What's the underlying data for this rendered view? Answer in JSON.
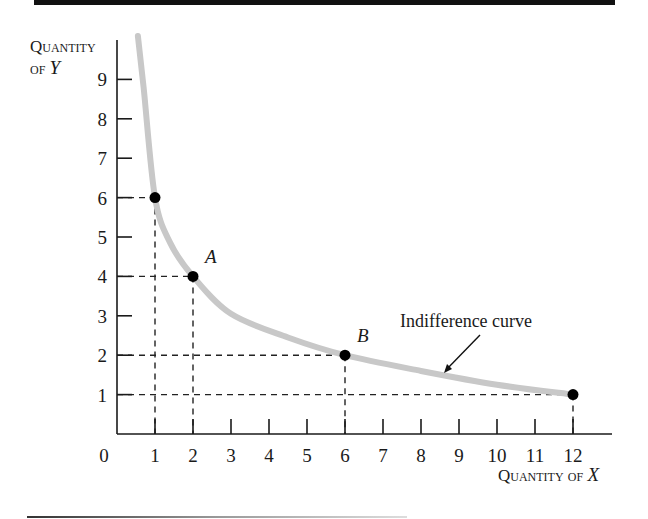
{
  "chart_data": {
    "type": "line",
    "title": "",
    "xlabel": "Quantity of X",
    "ylabel": "Quantity of Y",
    "xlim": [
      0,
      12.9
    ],
    "ylim": [
      0,
      10
    ],
    "x_ticks": [
      "0",
      "1",
      "2",
      "3",
      "4",
      "5",
      "6",
      "7",
      "8",
      "9",
      "10",
      "11",
      "12"
    ],
    "y_ticks": [
      "1",
      "2",
      "3",
      "4",
      "5",
      "6",
      "7",
      "8",
      "9"
    ],
    "grid": false,
    "series": [
      {
        "name": "Indifference curve",
        "points": [
          {
            "x": 1,
            "y": 6,
            "label": ""
          },
          {
            "x": 2,
            "y": 4,
            "label": "A"
          },
          {
            "x": 6,
            "y": 2,
            "label": "B"
          },
          {
            "x": 12,
            "y": 1,
            "label": ""
          }
        ],
        "color": "#c8c8c8"
      }
    ],
    "annotations": [
      {
        "text": "Indifference curve",
        "arrow_to": "curve near x=8"
      },
      {
        "text": "A",
        "at": [
          2,
          4
        ]
      },
      {
        "text": "B",
        "at": [
          6,
          2
        ]
      }
    ],
    "guides": "dashed projection lines from each marked point to both axes"
  },
  "labels": {
    "y_axis_line1": "Quantity",
    "y_axis_line2_prefix": "of ",
    "y_axis_var": "Y",
    "x_axis_prefix": "Quantity of ",
    "x_axis_var": "X",
    "origin": "0",
    "curve_name": "Indifference curve",
    "point_a": "A",
    "point_b": "B"
  },
  "colors": {
    "curve": "#c8c8c8",
    "axis": "#1a1a1a",
    "point": "#000000"
  }
}
